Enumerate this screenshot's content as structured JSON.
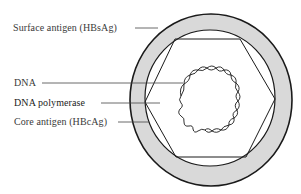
{
  "diagram": {
    "type": "hepatitis-b-virion-structure",
    "labels": [
      {
        "id": "surface-antigen",
        "text": "Surface antigen (HBsAg)",
        "x": 13,
        "y": 22
      },
      {
        "id": "dna",
        "text": "DNA",
        "x": 14,
        "y": 77
      },
      {
        "id": "dna-polymerase",
        "text": "DNA polymerase",
        "x": 14,
        "y": 97
      },
      {
        "id": "core-antigen",
        "text": "Core antigen (HBcAg)",
        "x": 14,
        "y": 116
      }
    ],
    "colors": {
      "envelope_fill": "#d9d9d9",
      "stroke": "#1a1a1a",
      "leader_line": "#444444",
      "text": "#3a3a3a"
    }
  }
}
